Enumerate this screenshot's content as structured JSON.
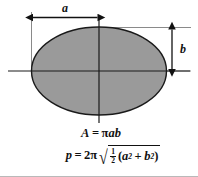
{
  "figure": {
    "name": "ellipse-dimension-diagram",
    "shape": "ellipse",
    "fill_color": "#9a9a9a",
    "stroke_color": "#1a1a1a",
    "background_color": "#ffffff",
    "labels": {
      "semi_major": "a",
      "semi_minor": "b"
    },
    "dimensions": {
      "semi_major_label": "a",
      "semi_major_description": "horizontal dimension from left extension line to vertical center axis",
      "semi_minor_label": "b",
      "semi_minor_description": "vertical dimension from top tangent line down to horizontal center axis"
    }
  },
  "formulas": {
    "area": {
      "lhs": "A",
      "equals": "=",
      "pi": "π",
      "a": "a",
      "b": "b"
    },
    "perimeter": {
      "lhs": "p",
      "equals": "=",
      "coefficient": "2",
      "pi": "π",
      "radical": "√",
      "fraction_numerator": "1",
      "fraction_denominator": "2",
      "open_paren": "(",
      "a": "a",
      "a_exponent": "2",
      "plus": "+",
      "b": "b",
      "b_exponent": "2",
      "close_paren": ")"
    }
  }
}
